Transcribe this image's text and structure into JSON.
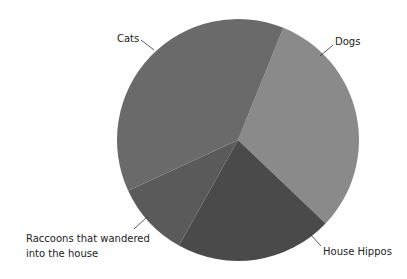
{
  "chart_data": {
    "type": "pie",
    "title": "",
    "start_angle_deg": 22,
    "direction": "clockwise",
    "slices": [
      {
        "label": "Dogs",
        "value": 31,
        "color": "#8a8a8a"
      },
      {
        "label": "House Hippos",
        "value": 21,
        "color": "#4a4a4a"
      },
      {
        "label": "Raccoons that wandered into the house",
        "value": 10,
        "color": "#5a5a5a"
      },
      {
        "label": "Cats",
        "value": 38,
        "color": "#6a6a6a"
      }
    ],
    "legend": "none",
    "labels_outside_with_leader_lines": true
  },
  "labels": {
    "cats": "Cats",
    "dogs": "Dogs",
    "hippos": "House Hippos",
    "raccoons_line1": "Raccoons that wandered",
    "raccoons_line2": "into the house"
  }
}
